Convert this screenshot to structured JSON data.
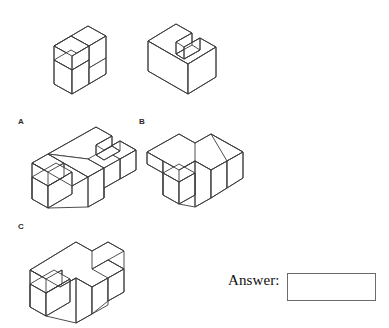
{
  "page": {
    "type": "spatial-reasoning-question",
    "background_color": "#ffffff",
    "line_color": "#3a3a3a",
    "width": 389,
    "height": 328
  },
  "prompt_figures": [
    {
      "id": "prompt-figure-1",
      "name": "stimulus-block-left",
      "description": "Isometric line drawing of a stepped block (two-level staircase solid)"
    },
    {
      "id": "prompt-figure-2",
      "name": "stimulus-block-right",
      "description": "Isometric line drawing of a cube with a notched channel cut along the top"
    }
  ],
  "options": [
    {
      "key": "A",
      "label": "A",
      "name": "option-a",
      "description": "Isometric line drawing of a cross/T shaped block with stepped left end and notched top"
    },
    {
      "key": "B",
      "label": "B",
      "name": "option-b",
      "description": "Isometric line drawing of a cross shaped block with a lower left arm"
    },
    {
      "key": "C",
      "label": "C",
      "name": "option-c",
      "description": "Isometric line drawing of a cross shaped block with stepped left end"
    }
  ],
  "answer": {
    "label": "Answer:",
    "value": "",
    "placeholder": ""
  }
}
